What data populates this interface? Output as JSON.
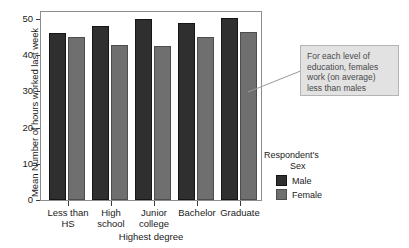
{
  "chart_data": {
    "type": "bar",
    "title": "",
    "xlabel": "Highest degree",
    "ylabel": "Mean Number of hours worked last week",
    "categories": [
      "Less than\nHS",
      "High\nschool",
      "Junior\ncollege",
      "Bachelor",
      "Graduate"
    ],
    "series": [
      {
        "name": "Male",
        "color": "#2f2f2f",
        "values": [
          45.6,
          47.5,
          49.5,
          48.4,
          49.7
        ]
      },
      {
        "name": "Female",
        "color": "#6f6f6f",
        "values": [
          44.4,
          42.3,
          42.1,
          44.5,
          45.9
        ]
      }
    ],
    "ylim": [
      0,
      50
    ],
    "yticks": [
      0,
      10,
      20,
      30,
      40,
      50
    ],
    "ytick_labels": [
      "0",
      "10",
      "20",
      "30",
      "40",
      "50"
    ],
    "grid": false,
    "legend_position": "right"
  },
  "legend": {
    "title_line1": "Respondent's",
    "title_line2": "Sex",
    "entries": [
      {
        "label": "Male"
      },
      {
        "label": "Female"
      }
    ]
  },
  "annotation": {
    "text": "For each level of education, females work (on average) less than males",
    "box_color": "#e2e2e2",
    "border_color": "#b4b4b4",
    "text_color": "#4a4a4a"
  },
  "colors": {
    "male": "#2f2f2f",
    "female": "#6f6f6f",
    "axis": "#8d8d8d",
    "background": "#ffffff"
  }
}
